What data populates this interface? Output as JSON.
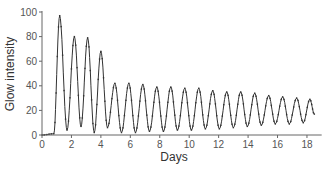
{
  "chart_data": {
    "type": "line",
    "title": "",
    "xlabel": "Days",
    "ylabel": "Glow intensity",
    "xlim": [
      0,
      19
    ],
    "ylim": [
      0,
      100
    ],
    "xticks": [
      0,
      2,
      4,
      6,
      8,
      10,
      12,
      14,
      16,
      18
    ],
    "yticks": [
      0,
      20,
      40,
      60,
      80,
      100
    ],
    "grid": false,
    "legend": null,
    "series": [
      {
        "name": "Glow intensity",
        "peaks": [
          {
            "x": 1.2,
            "y": 97
          },
          {
            "x": 2.2,
            "y": 80
          },
          {
            "x": 3.1,
            "y": 79
          },
          {
            "x": 4.0,
            "y": 68
          },
          {
            "x": 4.95,
            "y": 42
          },
          {
            "x": 5.9,
            "y": 42
          },
          {
            "x": 6.85,
            "y": 41
          },
          {
            "x": 7.8,
            "y": 39
          },
          {
            "x": 8.75,
            "y": 39
          },
          {
            "x": 9.7,
            "y": 38
          },
          {
            "x": 10.65,
            "y": 38
          },
          {
            "x": 11.6,
            "y": 36
          },
          {
            "x": 12.55,
            "y": 35
          },
          {
            "x": 13.5,
            "y": 35
          },
          {
            "x": 14.45,
            "y": 34
          },
          {
            "x": 15.4,
            "y": 32
          },
          {
            "x": 16.35,
            "y": 31
          },
          {
            "x": 17.3,
            "y": 30
          },
          {
            "x": 18.2,
            "y": 29
          }
        ],
        "troughs": [
          {
            "x": 0.0,
            "y": 0
          },
          {
            "x": 0.8,
            "y": 1
          },
          {
            "x": 1.7,
            "y": 4
          },
          {
            "x": 2.65,
            "y": 7
          },
          {
            "x": 3.55,
            "y": 2
          },
          {
            "x": 4.45,
            "y": 6
          },
          {
            "x": 5.4,
            "y": 2
          },
          {
            "x": 6.35,
            "y": 2
          },
          {
            "x": 7.3,
            "y": 3
          },
          {
            "x": 8.25,
            "y": 3
          },
          {
            "x": 9.2,
            "y": 4
          },
          {
            "x": 10.15,
            "y": 4
          },
          {
            "x": 11.1,
            "y": 5
          },
          {
            "x": 12.05,
            "y": 5
          },
          {
            "x": 13.0,
            "y": 6
          },
          {
            "x": 13.95,
            "y": 7
          },
          {
            "x": 14.9,
            "y": 8
          },
          {
            "x": 15.85,
            "y": 9
          },
          {
            "x": 16.8,
            "y": 9
          },
          {
            "x": 17.75,
            "y": 10
          }
        ],
        "end": {
          "x": 18.5,
          "y": 17
        }
      }
    ]
  },
  "colors": {
    "line": "#333333",
    "axis": "#666666",
    "text": "#555555"
  }
}
